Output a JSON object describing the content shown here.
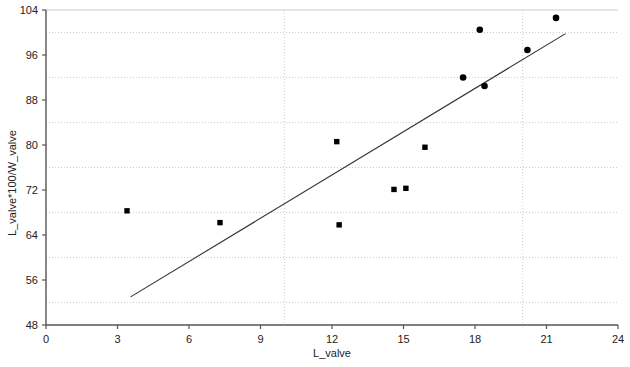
{
  "chart_data": {
    "type": "scatter",
    "title": "",
    "subtitle": "",
    "xlabel": "L_valve",
    "ylabel": "L_valve*100/W_valve",
    "xlim": [
      0,
      24
    ],
    "ylim": [
      48,
      104
    ],
    "xticks": [
      0,
      3,
      6,
      9,
      12,
      15,
      18,
      21,
      24
    ],
    "xtick_labels": [
      "0",
      "3",
      "6",
      "9",
      "12",
      "15",
      "18",
      "21",
      "24"
    ],
    "yticks": [
      48,
      56,
      64,
      72,
      80,
      88,
      96,
      104
    ],
    "ytick_labels": [
      "48",
      "56",
      "64",
      "72",
      "80",
      "88",
      "96",
      "104"
    ],
    "grid": true,
    "grid_style": "dotted",
    "x_gridlines": [
      10,
      20
    ],
    "y_gridlines": [
      52,
      60,
      68,
      76,
      84,
      92,
      100
    ],
    "legend": "none",
    "legend_position": "none",
    "annotations": [],
    "series": [
      {
        "name": "squares",
        "marker": "square",
        "color": "#000000",
        "points": [
          {
            "x": 3.4,
            "y": 68.3
          },
          {
            "x": 7.3,
            "y": 66.2
          },
          {
            "x": 12.2,
            "y": 80.6
          },
          {
            "x": 12.3,
            "y": 65.8
          },
          {
            "x": 14.6,
            "y": 72.1
          },
          {
            "x": 15.1,
            "y": 72.3
          },
          {
            "x": 15.9,
            "y": 79.6
          }
        ]
      },
      {
        "name": "circles",
        "marker": "circle",
        "color": "#000000",
        "points": [
          {
            "x": 17.5,
            "y": 92.0
          },
          {
            "x": 18.2,
            "y": 100.5
          },
          {
            "x": 18.4,
            "y": 90.5
          },
          {
            "x": 20.2,
            "y": 96.9
          },
          {
            "x": 21.4,
            "y": 102.6
          }
        ]
      }
    ],
    "fit_line": {
      "name": "regression-line",
      "color": "#333333",
      "x1": 3.55,
      "y1": 53.0,
      "x2": 21.8,
      "y2": 99.8
    }
  },
  "axes": {
    "x_axis_label": "L_valve",
    "y_axis_label": "L_valve*100/W_valve"
  },
  "colors": {
    "marker": "#000000",
    "line": "#333333",
    "grid": "#cccccc",
    "axis": "#555555",
    "background": "#ffffff",
    "text": "#222222"
  }
}
